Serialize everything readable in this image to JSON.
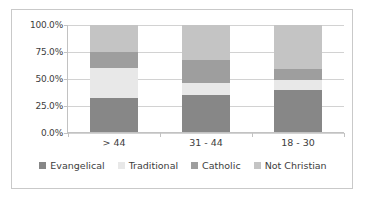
{
  "chart_data": {
    "type": "bar",
    "subtype": "stacked-100-percent",
    "title": "",
    "xlabel": "",
    "ylabel": "",
    "categories": [
      "> 44",
      "31 - 44",
      "18 - 30"
    ],
    "ylim": [
      0,
      100
    ],
    "ytick_labels": [
      "0.0%",
      "25.0%",
      "50.0%",
      "75.0%",
      "100.0%"
    ],
    "ytick_values": [
      0,
      25,
      50,
      75,
      100
    ],
    "grid": true,
    "legend_position": "bottom",
    "series": [
      {
        "name": "Evangelical",
        "color": "#878787",
        "values": [
          32,
          35,
          40
        ]
      },
      {
        "name": "Traditional",
        "color": "#e8e8e8",
        "values": [
          28,
          11,
          9
        ]
      },
      {
        "name": "Catholic",
        "color": "#9e9e9e",
        "values": [
          15,
          22,
          10
        ]
      },
      {
        "name": "Not Christian",
        "color": "#c4c4c4",
        "values": [
          25,
          32,
          41
        ]
      }
    ]
  },
  "legend": {
    "items": [
      {
        "label": "Evangelical",
        "color": "#878787"
      },
      {
        "label": "Traditional",
        "color": "#e8e8e8"
      },
      {
        "label": "Catholic",
        "color": "#9e9e9e"
      },
      {
        "label": "Not Christian",
        "color": "#c4c4c4"
      }
    ]
  },
  "axes": {
    "y_ticks": [
      "100.0%",
      "75.0%",
      "50.0%",
      "25.0%",
      "0.0%"
    ],
    "x_ticks": [
      "> 44",
      "31 - 44",
      "18 - 30"
    ]
  }
}
